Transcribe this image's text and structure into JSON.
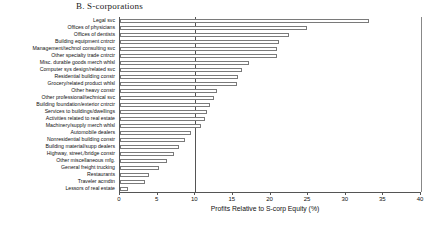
{
  "panel": {
    "title": "B. S-corporations"
  },
  "chart_data": {
    "type": "bar",
    "orientation": "horizontal",
    "title": "B. S-corporations",
    "xlabel": "Profits Relative to S-corp Equity (%)",
    "ylabel": "",
    "xlim": [
      0,
      40
    ],
    "xticks": [
      0,
      5,
      10,
      15,
      20,
      25,
      30,
      35,
      40
    ],
    "xtick_labels": [
      "0",
      "5",
      "10",
      "15",
      "20",
      "25",
      "30",
      "35",
      "40"
    ],
    "grid": false,
    "legend": null,
    "reference_line": 10,
    "bar_fill_color": "#ffffff",
    "bar_edge_color": "#7a7a7a",
    "categories": [
      "Legal svc",
      "Offices of physicians",
      "Offices of dentists",
      "Building equipment cntrctr",
      "Management/technol consulting svc",
      "Other specialty trade cntrctr",
      "Misc. durable goods merch whlsl",
      "Computer sys design/related svc",
      "Residential building constr",
      "Grocery/related product whlsl",
      "Other heavy constr",
      "Other professional/technical svc",
      "Building foundation/exterior cntrctr",
      "Services to buildings/dwellings",
      "Activities related to real estate",
      "Machinery/supply merch whlsl",
      "Automobile dealers",
      "Nonresidential building constr",
      "Building material/supp dealers",
      "Highway, street,/bridge constr",
      "Other miscellaneous mfg.",
      "General freight trucking",
      "Restaurants",
      "Traveler acmdtn",
      "Lessors of real estate"
    ],
    "values": [
      33.1,
      24.9,
      22.5,
      21.1,
      20.9,
      20.8,
      17.2,
      16.2,
      15.7,
      15.6,
      12.9,
      12.5,
      11.9,
      11.6,
      11.3,
      10.8,
      9.4,
      8.7,
      7.9,
      7.2,
      6.3,
      5.2,
      3.9,
      3.3,
      1.0
    ]
  }
}
